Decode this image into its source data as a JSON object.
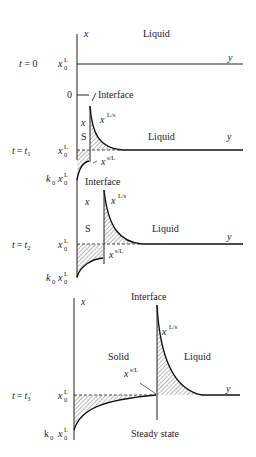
{
  "panels": [
    {
      "id": "t0",
      "time_label": "t = 0",
      "axis_x_label": "x",
      "axis_y_label": "y",
      "region_labels": [
        "Liquid"
      ],
      "level_label": "x0L",
      "extra_labels": [
        "0",
        "Interface"
      ]
    },
    {
      "id": "t1",
      "time_label": "t = t1",
      "axis_x_label": "x",
      "axis_y_label": "y",
      "region_labels": [
        "S",
        "Liquid"
      ],
      "curve_labels": [
        "xL/s",
        "xs/L"
      ],
      "level_labels": [
        "x0L",
        "k0 x0L"
      ],
      "extra_labels": [
        "Interface"
      ]
    },
    {
      "id": "t2",
      "time_label": "t = t2",
      "axis_x_label": "x",
      "axis_y_label": "y",
      "region_labels": [
        "S",
        "Liquid"
      ],
      "curve_labels": [
        "xL/s",
        "xs/L"
      ],
      "level_labels": [
        "x0L",
        "k0 x0L"
      ],
      "extra_labels": [
        "Interface"
      ]
    },
    {
      "id": "t3",
      "time_label": "t = t3",
      "axis_x_label": "x",
      "axis_y_label": "y",
      "region_labels": [
        "Solid",
        "Liquid"
      ],
      "curve_labels": [
        "xL/s",
        "xs/L"
      ],
      "level_labels": [
        "x0L",
        "k0 x0L"
      ],
      "caption": "Steady state"
    }
  ],
  "text": {
    "x": "x",
    "y": "y",
    "liquid": "Liquid",
    "solid": "Solid",
    "s": "S",
    "interface": "Interface",
    "zero": "0",
    "steady": "Steady state",
    "t_eq": "t =",
    "t0_val": "0",
    "t_sym": "t",
    "sub1": "1",
    "sub2": "2",
    "sub3": "3",
    "k": "k",
    "k_roman": "k",
    "sub0": "0",
    "supL": "L",
    "supLs": "L/s",
    "supsL": "s/L"
  }
}
